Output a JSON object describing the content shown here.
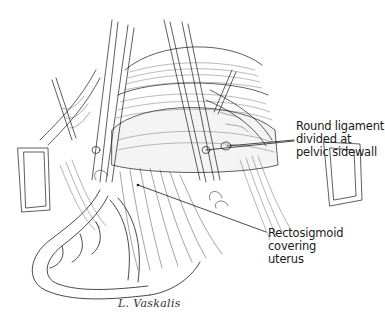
{
  "figure": {
    "labels": [
      {
        "id": "round-ligament",
        "lines": [
          "Round ligament",
          "divided at",
          "pelvic sidewall"
        ],
        "position": {
          "x": 296,
          "y": 120
        },
        "leaders": [
          {
            "x1": 294,
            "y1": 140,
            "x2": 227,
            "y2": 146
          },
          {
            "x1": 294,
            "y1": 141,
            "x2": 206,
            "y2": 150
          }
        ]
      },
      {
        "id": "rectosigmoid",
        "lines": [
          "Rectosigmoid",
          "covering",
          "uterus"
        ],
        "position": {
          "x": 268,
          "y": 227
        },
        "leaders": [
          {
            "x1": 266,
            "y1": 232,
            "x2": 138,
            "y2": 185
          }
        ]
      }
    ],
    "signature": "L. Vaskalis"
  },
  "colors": {
    "ink": "#1a1a1a",
    "background": "#ffffff",
    "shade": "#555555"
  }
}
